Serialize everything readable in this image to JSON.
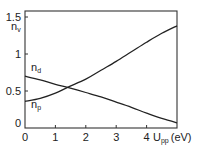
{
  "chart_data": {
    "type": "line",
    "title": "",
    "xlabel": "U_pp (eV)",
    "xlabel_main": "U",
    "xlabel_sub": "pp",
    "xlabel_unit": "(eV)",
    "ylabel": "n_v",
    "ylabel_main": "n",
    "ylabel_sub": "v",
    "xlim": [
      0,
      5
    ],
    "ylim": [
      0,
      1.55
    ],
    "xticks": [
      0,
      1,
      2,
      3,
      4
    ],
    "xtick_labels": [
      "0",
      "1",
      "2",
      "3",
      "4"
    ],
    "yticks": [
      0,
      0.5,
      1,
      1.5
    ],
    "ytick_labels": [
      "0",
      "0.5",
      "1",
      "1.5"
    ],
    "grid": false,
    "legend": "inline labels",
    "series": [
      {
        "name": "n_d",
        "label_main": "n",
        "label_sub": "d",
        "x": [
          0,
          0.5,
          1,
          1.4,
          2,
          2.5,
          3,
          3.5,
          4,
          4.5,
          5
        ],
        "values": [
          0.7,
          0.65,
          0.59,
          0.55,
          0.48,
          0.42,
          0.35,
          0.28,
          0.2,
          0.13,
          0.07
        ]
      },
      {
        "name": "n_p",
        "label_main": "n",
        "label_sub": "p",
        "x": [
          0,
          0.5,
          1,
          1.4,
          2,
          2.5,
          3,
          3.5,
          4,
          4.5,
          5
        ],
        "values": [
          0.36,
          0.4,
          0.47,
          0.55,
          0.66,
          0.78,
          0.9,
          1.03,
          1.16,
          1.28,
          1.38
        ]
      }
    ]
  }
}
